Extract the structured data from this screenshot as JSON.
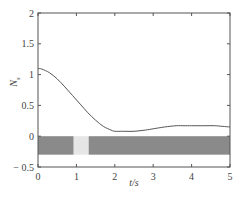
{
  "chart_data": {
    "type": "line",
    "title": "",
    "xlabel": "t/s",
    "ylabel": "N_s",
    "xlim": [
      0,
      5
    ],
    "ylim": [
      -0.5,
      2
    ],
    "xticks": [
      "0",
      "1",
      "2",
      "3",
      "4",
      "5"
    ],
    "yticks": [
      "-0.5",
      "0",
      "0.5",
      "1",
      "1.5",
      "2"
    ],
    "grid": false,
    "legend": null,
    "series": [
      {
        "name": "N_s",
        "x": [
          0,
          0.1,
          0.3,
          0.5,
          0.7,
          0.9,
          1.1,
          1.3,
          1.5,
          1.7,
          1.9,
          2.0,
          2.2,
          2.5,
          2.8,
          3.0,
          3.3,
          3.6,
          3.8,
          4.0,
          4.3,
          4.6,
          4.8,
          5.0
        ],
        "y": [
          1.1,
          1.09,
          1.03,
          0.93,
          0.8,
          0.66,
          0.52,
          0.38,
          0.26,
          0.16,
          0.1,
          0.08,
          0.08,
          0.08,
          0.1,
          0.12,
          0.15,
          0.17,
          0.17,
          0.17,
          0.17,
          0.17,
          0.16,
          0.15
        ]
      }
    ],
    "annotations": [
      {
        "type": "band",
        "description": "dark gray horizontal bar below curve with a light gap",
        "y_range": [
          -0.3,
          0.0
        ],
        "segments": [
          {
            "x_range": [
              0,
              0.93
            ],
            "shade": "dark"
          },
          {
            "x_range": [
              0.93,
              1.32
            ],
            "shade": "light"
          },
          {
            "x_range": [
              1.32,
              5
            ],
            "shade": "dark"
          }
        ]
      }
    ]
  },
  "colors": {
    "axis": "#555555",
    "line": "#555555",
    "band_dark": "#8a8a8a",
    "band_light": "#e6e6e6"
  },
  "labels": {
    "xlabel": "t/s",
    "ylabel": "N",
    "ylabel_sub": "s"
  }
}
